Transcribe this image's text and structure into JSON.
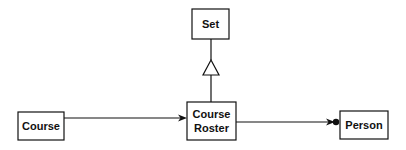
{
  "diagram": {
    "type": "UML class diagram",
    "nodes": {
      "set": {
        "label": "Set"
      },
      "course": {
        "label": "Course"
      },
      "course_roster": {
        "label_line1": "Course",
        "label_line2": "Roster"
      },
      "person": {
        "label": "Person"
      }
    },
    "edges": [
      {
        "from": "Course",
        "to": "Course Roster",
        "type": "association-arrow"
      },
      {
        "from": "Course Roster",
        "to": "Set",
        "type": "generalization"
      },
      {
        "from": "Course Roster",
        "to": "Person",
        "type": "association-arrow-with-dot"
      }
    ]
  }
}
